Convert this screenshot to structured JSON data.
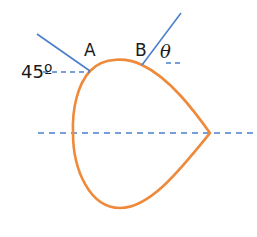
{
  "diagram": {
    "type": "ray-through-drop-shaped-prism",
    "labels": {
      "point_a": "A",
      "point_b": "B",
      "angle_incidence": "45º",
      "angle_exit": "θ"
    },
    "colors": {
      "shape": "#ee8a3c",
      "ray": "#4a7fcb",
      "dashed": "#4a7fcb",
      "text": "#1a1a1a"
    },
    "points": {
      "A": [
        90,
        71
      ],
      "B": [
        142,
        65
      ],
      "right_tip": [
        210,
        133
      ],
      "left_extreme": [
        73,
        133
      ],
      "bottom": [
        120,
        208
      ]
    },
    "axis": {
      "y": 133,
      "x_start": 38,
      "x_end": 257
    }
  }
}
